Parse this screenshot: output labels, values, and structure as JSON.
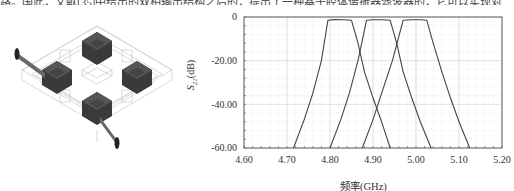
{
  "top_text": "路。国此，文献[35]中给出的双相输出结构之后的，提出了一种基于腔体谐振器滤波器的，它可以实现对",
  "figure": {
    "left_panel": {
      "description": "3D model of cavity resonator filter: four dark cubic resonators arranged in a diamond with two feed lines",
      "icon": "filter-3d-model"
    },
    "right_panel": {
      "ylabel_main": "S",
      "ylabel_sub": "21",
      "ylabel_unit": "(dB)",
      "xlabel": "频率(GHz)"
    }
  },
  "chart_data": {
    "type": "line",
    "title": "",
    "xlabel": "频率(GHz)",
    "ylabel": "S21(dB)",
    "xlim": [
      4.6,
      5.2
    ],
    "ylim": [
      -60,
      0
    ],
    "x_ticks": [
      "4.60",
      "4.70",
      "4.80",
      "4.90",
      "5.00",
      "5.10",
      "5.20"
    ],
    "y_ticks": [
      "0",
      "-20.00",
      "-40.00",
      "-60.00"
    ],
    "grid": true,
    "legend": null,
    "series": [
      {
        "name": "Filter 1",
        "x": [
          4.715,
          4.74,
          4.76,
          4.78,
          4.795,
          4.81,
          4.83,
          4.85,
          4.865,
          4.88,
          4.9,
          4.92,
          4.94
        ],
        "y": [
          -60,
          -47,
          -35,
          -20,
          -1.5,
          -1.2,
          -1.3,
          -1.5,
          -12,
          -25,
          -37,
          -48,
          -60
        ]
      },
      {
        "name": "Filter 2",
        "x": [
          4.8,
          4.825,
          4.845,
          4.865,
          4.885,
          4.9,
          4.92,
          4.94,
          4.955,
          4.97,
          4.99,
          5.01,
          5.035
        ],
        "y": [
          -60,
          -47,
          -35,
          -20,
          -1.5,
          -1.3,
          -1.3,
          -1.5,
          -12,
          -25,
          -37,
          -48,
          -60
        ]
      },
      {
        "name": "Filter 3",
        "x": [
          4.875,
          4.9,
          4.92,
          4.945,
          4.97,
          4.99,
          5.01,
          5.025,
          5.04,
          5.06,
          5.08,
          5.1,
          5.125
        ],
        "y": [
          -60,
          -47,
          -35,
          -20,
          -1.5,
          -1.3,
          -1.3,
          -1.5,
          -12,
          -25,
          -37,
          -48,
          -60
        ]
      }
    ],
    "colors": {
      "curve": "#444444",
      "grid_major": "#d8d8d8",
      "grid_minor": "#eeeeee",
      "axis": "#555555"
    }
  }
}
